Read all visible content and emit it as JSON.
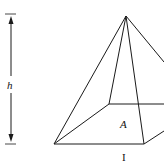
{
  "diagram": {
    "type": "pyramid-volume",
    "labels": {
      "height": "h",
      "base_area": "A",
      "base_side": "I"
    },
    "stroke_color": "#1a1a1a",
    "background": "#ffffff"
  }
}
